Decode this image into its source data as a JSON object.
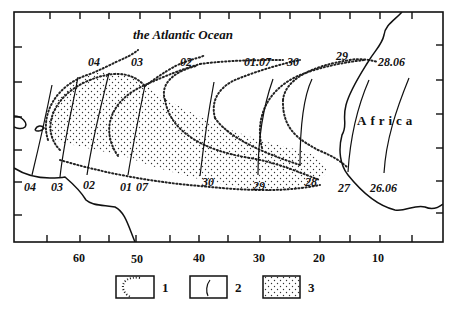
{
  "map": {
    "ocean_label": "the Atlantic Ocean",
    "continent_label": "Africa",
    "x_axis": {
      "tick_labels": [
        "60",
        "50",
        "40",
        "30",
        "20",
        "10"
      ]
    },
    "isoline_labels_top": [
      "04",
      "03",
      "02",
      "01.07",
      "30",
      "29",
      "28.06"
    ],
    "isoline_labels_bottom": [
      "04",
      "03",
      "02",
      "01",
      "07",
      "30",
      "29",
      "28",
      "27",
      "26.06"
    ],
    "legend": [
      {
        "key": "1",
        "symbol": "dotted-envelope"
      },
      {
        "key": "2",
        "symbol": "isoline"
      },
      {
        "key": "3",
        "symbol": "stippled-area"
      }
    ]
  }
}
